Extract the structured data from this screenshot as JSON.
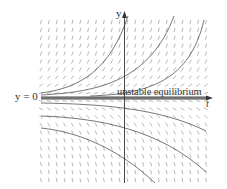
{
  "diagram": {
    "axes": {
      "horizontal_label": "t",
      "vertical_label": "y"
    },
    "labels": {
      "equilibrium_value": "y = 0",
      "equilibrium_annotation": "unstable equilibrium"
    },
    "colors": {
      "slope_marks": "#9a9a9a",
      "curves": "#555555",
      "axes": "#333333",
      "equilibrium_band": "#666666"
    },
    "slope_field": {
      "columns": 22,
      "rows": 21,
      "x_range": [
        41,
        206
      ],
      "y_range": [
        22,
        180
      ],
      "equilibrium_row_y": 98
    },
    "solution_curves": {
      "above_equilibrium": 3,
      "below_equilibrium": 3,
      "behavior_above": "grow rapidly upward (exponential)",
      "behavior_below": "decrease downward away from y = 0"
    }
  }
}
